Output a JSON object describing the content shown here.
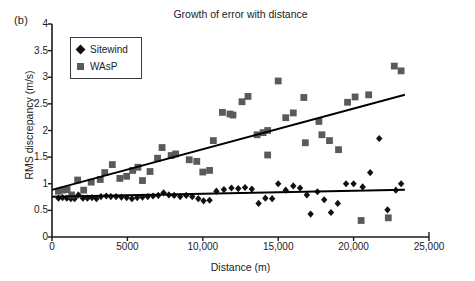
{
  "panel": {
    "label": "(b)"
  },
  "chart_data": {
    "type": "scatter",
    "title": "Growth of error with distance",
    "xlabel": "Distance (m)",
    "ylabel": "RMS discrepancy (m/s)",
    "xlim": [
      0,
      25000
    ],
    "ylim": [
      0,
      4
    ],
    "grid": false,
    "legend_position": "top-left-inside",
    "xticks": [
      0,
      5000,
      10000,
      15000,
      20000,
      25000
    ],
    "xtick_labels": [
      "0",
      "5000",
      "10,000",
      "15,000",
      "20,000",
      "25,000"
    ],
    "yticks": [
      0,
      0.5,
      1,
      1.5,
      2,
      2.5,
      3,
      3.5,
      4
    ],
    "ytick_labels": [
      "0",
      "0.5",
      "1",
      "1.5",
      "2",
      "2.5",
      "3",
      "3.5",
      "4"
    ],
    "series": [
      {
        "name": "Sitewind",
        "marker": "diamond",
        "color": "#111111",
        "points": [
          [
            430,
            0.73
          ],
          [
            700,
            0.74
          ],
          [
            980,
            0.73
          ],
          [
            1250,
            0.72
          ],
          [
            1500,
            0.72
          ],
          [
            1750,
            0.79
          ],
          [
            2050,
            0.73
          ],
          [
            2350,
            0.73
          ],
          [
            2650,
            0.74
          ],
          [
            2950,
            0.72
          ],
          [
            3250,
            0.76
          ],
          [
            3600,
            0.77
          ],
          [
            3900,
            0.76
          ],
          [
            4250,
            0.76
          ],
          [
            4600,
            0.75
          ],
          [
            4950,
            0.74
          ],
          [
            5300,
            0.72
          ],
          [
            5650,
            0.74
          ],
          [
            6000,
            0.75
          ],
          [
            6350,
            0.76
          ],
          [
            6700,
            0.77
          ],
          [
            7050,
            0.78
          ],
          [
            7400,
            0.83
          ],
          [
            7750,
            0.79
          ],
          [
            8100,
            0.78
          ],
          [
            8500,
            0.76
          ],
          [
            8900,
            0.78
          ],
          [
            9300,
            0.76
          ],
          [
            9700,
            0.72
          ],
          [
            10050,
            0.68
          ],
          [
            10450,
            0.69
          ],
          [
            10900,
            0.86
          ],
          [
            11400,
            0.89
          ],
          [
            11900,
            0.92
          ],
          [
            12350,
            0.91
          ],
          [
            12800,
            0.93
          ],
          [
            13250,
            0.9
          ],
          [
            13700,
            0.63
          ],
          [
            14150,
            0.73
          ],
          [
            14600,
            0.72
          ],
          [
            15000,
            1.0
          ],
          [
            15500,
            0.88
          ],
          [
            16000,
            0.96
          ],
          [
            16450,
            0.92
          ],
          [
            16900,
            0.79
          ],
          [
            17150,
            0.43
          ],
          [
            17600,
            0.85
          ],
          [
            18050,
            0.7
          ],
          [
            18500,
            0.46
          ],
          [
            18950,
            0.63
          ],
          [
            19500,
            1.0
          ],
          [
            20000,
            1.0
          ],
          [
            20600,
            0.94
          ],
          [
            21100,
            1.21
          ],
          [
            21700,
            1.85
          ],
          [
            22250,
            0.51
          ],
          [
            22800,
            0.88
          ],
          [
            23150,
            1.0
          ]
        ],
        "trend": {
          "x0": 0,
          "y0": 0.755,
          "x1": 23400,
          "y1": 0.885
        }
      },
      {
        "name": "WAsP",
        "marker": "square",
        "color": "#5a5a5a",
        "points": [
          [
            430,
            0.86
          ],
          [
            700,
            0.88
          ],
          [
            1000,
            0.89
          ],
          [
            1300,
            0.79
          ],
          [
            1700,
            1.07
          ],
          [
            2100,
            0.88
          ],
          [
            2600,
            1.03
          ],
          [
            3200,
            1.08
          ],
          [
            3500,
            1.21
          ],
          [
            4000,
            1.36
          ],
          [
            4500,
            1.1
          ],
          [
            4950,
            1.14
          ],
          [
            5350,
            1.25
          ],
          [
            5700,
            1.31
          ],
          [
            6000,
            1.06
          ],
          [
            6500,
            1.23
          ],
          [
            7000,
            1.48
          ],
          [
            7300,
            1.68
          ],
          [
            7900,
            1.53
          ],
          [
            8200,
            1.56
          ],
          [
            9100,
            1.45
          ],
          [
            9600,
            1.42
          ],
          [
            10000,
            1.22
          ],
          [
            10450,
            1.25
          ],
          [
            10700,
            1.81
          ],
          [
            11300,
            2.34
          ],
          [
            11800,
            2.31
          ],
          [
            12000,
            2.29
          ],
          [
            12600,
            2.54
          ],
          [
            13000,
            2.64
          ],
          [
            13600,
            1.92
          ],
          [
            14000,
            1.96
          ],
          [
            14300,
            2.0
          ],
          [
            14300,
            1.54
          ],
          [
            15000,
            2.93
          ],
          [
            15500,
            2.24
          ],
          [
            16000,
            2.33
          ],
          [
            16700,
            2.62
          ],
          [
            16800,
            1.77
          ],
          [
            17700,
            2.17
          ],
          [
            17900,
            1.92
          ],
          [
            18400,
            1.81
          ],
          [
            19000,
            1.64
          ],
          [
            19600,
            2.53
          ],
          [
            20100,
            2.63
          ],
          [
            20500,
            0.31
          ],
          [
            21000,
            2.67
          ],
          [
            22300,
            0.36
          ],
          [
            22700,
            3.21
          ],
          [
            23150,
            3.12
          ]
        ],
        "trend": {
          "x0": 0,
          "y0": 0.885,
          "x1": 23400,
          "y1": 2.67
        }
      }
    ]
  },
  "legend": {
    "items": [
      {
        "label": "Sitewind",
        "marker": "diamond",
        "color": "#111111"
      },
      {
        "label": "WAsP",
        "marker": "square",
        "color": "#5a5a5a"
      }
    ]
  }
}
